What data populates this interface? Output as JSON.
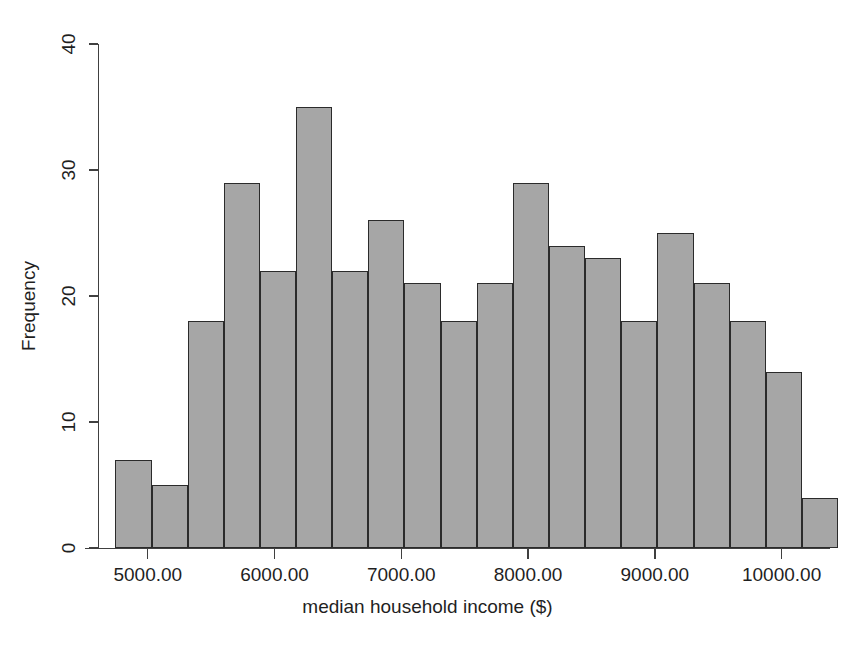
{
  "chart_data": {
    "type": "bar",
    "title": "",
    "subtitle": "",
    "xlabel": "median household income ($)",
    "ylabel": "Frequency",
    "xlim": [
      4615,
      10500
    ],
    "ylim": [
      0,
      40
    ],
    "grid": false,
    "legend": null,
    "bin_width": 285,
    "x_tick_values": [
      5000,
      6000,
      7000,
      8000,
      9000,
      10000
    ],
    "x_tick_labels": [
      "5000.00",
      "6000.00",
      "7000.00",
      "8000.00",
      "9000.00",
      "10000.00"
    ],
    "y_tick_values": [
      0,
      10,
      20,
      30,
      40
    ],
    "y_tick_labels": [
      "0",
      "10",
      "20",
      "30",
      "40"
    ],
    "bin_starts": [
      4745,
      5030,
      5315,
      5600,
      5885,
      6170,
      6455,
      6740,
      7025,
      7310,
      7595,
      7880,
      8165,
      8450,
      8735,
      9020,
      9305,
      9590,
      9875,
      10160
    ],
    "bin_ends": [
      5030,
      5315,
      5600,
      5885,
      6170,
      6455,
      6740,
      7025,
      7310,
      7595,
      7880,
      8165,
      8450,
      8735,
      9020,
      9305,
      9590,
      9875,
      10160,
      10445
    ],
    "categories": [
      "4745-5030",
      "5030-5315",
      "5315-5600",
      "5600-5885",
      "5885-6170",
      "6170-6455",
      "6455-6740",
      "6740-7025",
      "7025-7310",
      "7310-7595",
      "7595-7880",
      "7880-8165",
      "8165-8450",
      "8450-8735",
      "8735-9020",
      "9020-9305",
      "9305-9590",
      "9590-9875",
      "9875-10160",
      "10160-10445"
    ],
    "values": [
      7,
      5,
      18,
      29,
      22,
      35,
      22,
      26,
      21,
      18,
      21,
      29,
      24,
      23,
      18,
      25,
      21,
      18,
      14,
      4
    ],
    "bar_fill_color": "#a6a6a6",
    "bar_border_color": "#2b2b2b",
    "axis_color": "#404040",
    "background_color": "#ffffff"
  },
  "caption": {
    "text": ""
  },
  "figure": {
    "name": "histogram-median-household-income"
  }
}
